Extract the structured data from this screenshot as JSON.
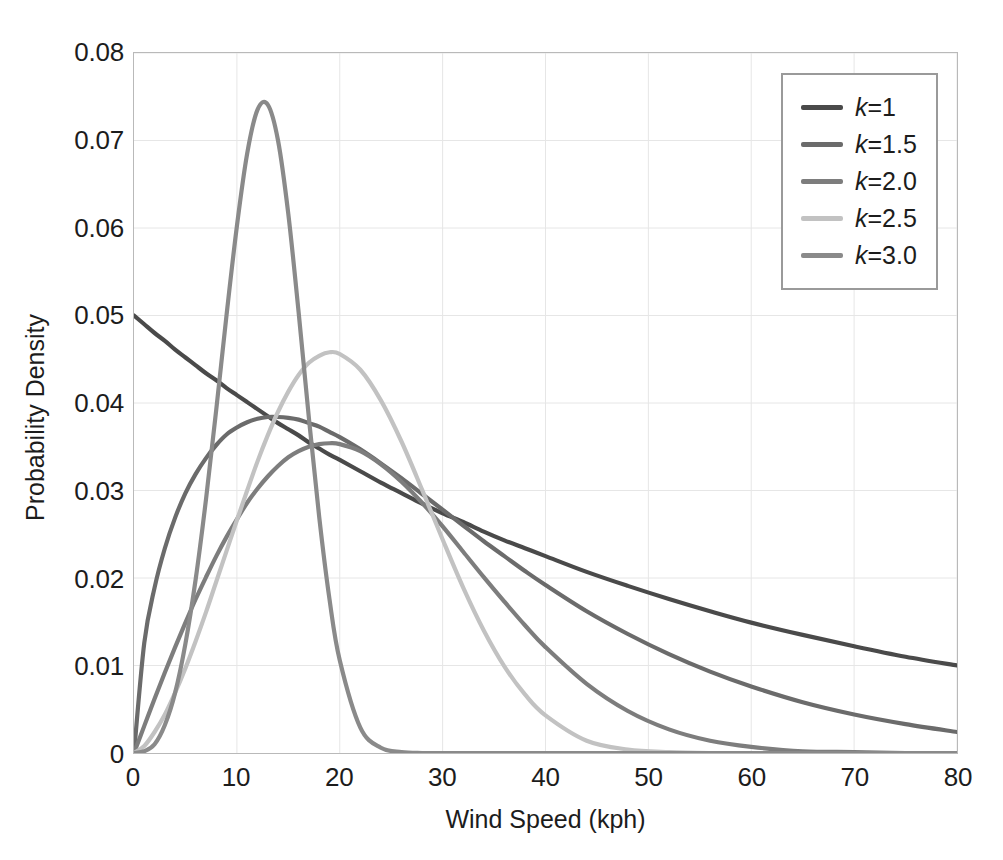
{
  "chart_data": {
    "type": "line",
    "title": "",
    "xlabel": "Wind Speed (kph)",
    "ylabel": "Probability Density",
    "xlim": [
      0,
      80
    ],
    "ylim": [
      0,
      0.08
    ],
    "grid": true,
    "legend_position": "top-right",
    "x_ticks": [
      "0",
      "10",
      "20",
      "30",
      "40",
      "50",
      "60",
      "70",
      "80"
    ],
    "x_tick_values": [
      0,
      10,
      20,
      30,
      40,
      50,
      60,
      70,
      80
    ],
    "y_ticks": [
      "0",
      "0.01",
      "0.02",
      "0.03",
      "0.04",
      "0.05",
      "0.06",
      "0.07",
      "0.08"
    ],
    "y_tick_values": [
      0,
      0.01,
      0.02,
      0.03,
      0.04,
      0.05,
      0.06,
      0.07,
      0.08
    ],
    "x": [
      0,
      1,
      2,
      3,
      4,
      5,
      6,
      7,
      8,
      9,
      10,
      11,
      12,
      13,
      14,
      15,
      16,
      17,
      18,
      19,
      20,
      22,
      24,
      26,
      28,
      30,
      32,
      34,
      36,
      38,
      40,
      44,
      48,
      52,
      56,
      60,
      65,
      70,
      75,
      80
    ],
    "series": [
      {
        "name": "k=1",
        "k": 1,
        "color": "#4a4a4a",
        "peak_x": 0,
        "peak_y": 0.05,
        "values": [
          0.05,
          0.049,
          0.048,
          0.0471,
          0.0461,
          0.0452,
          0.0443,
          0.0434,
          0.0426,
          0.0417,
          0.0409,
          0.0401,
          0.0393,
          0.0385,
          0.0377,
          0.037,
          0.0363,
          0.0355,
          0.0348,
          0.0341,
          0.0335,
          0.0322,
          0.0309,
          0.0297,
          0.0285,
          0.0274,
          0.0264,
          0.0253,
          0.0243,
          0.0234,
          0.0225,
          0.0207,
          0.0191,
          0.0176,
          0.0162,
          0.0149,
          0.0135,
          0.0122,
          0.011,
          0.01
        ]
      },
      {
        "name": "k=1.5",
        "k": 1.5,
        "color": "#6b6b6b",
        "peak_x": 10,
        "peak_y": 0.0372,
        "values": [
          0.0,
          0.0126,
          0.0189,
          0.0234,
          0.0269,
          0.0297,
          0.0319,
          0.0337,
          0.0352,
          0.0364,
          0.0372,
          0.0378,
          0.0382,
          0.0384,
          0.0384,
          0.0383,
          0.0381,
          0.0377,
          0.0373,
          0.0367,
          0.0361,
          0.0347,
          0.0331,
          0.0314,
          0.0296,
          0.0278,
          0.026,
          0.0242,
          0.0225,
          0.0208,
          0.0192,
          0.0162,
          0.0136,
          0.0113,
          0.0093,
          0.0076,
          0.0058,
          0.0044,
          0.0033,
          0.0024
        ]
      },
      {
        "name": "k=2.0",
        "k": 2.0,
        "color": "#7d7d7d",
        "peak_x": 16,
        "peak_y": 0.0428,
        "values": [
          0.0,
          0.0031,
          0.0062,
          0.0092,
          0.0121,
          0.0149,
          0.0176,
          0.0201,
          0.0225,
          0.0247,
          0.0267,
          0.0286,
          0.0302,
          0.0316,
          0.0328,
          0.0338,
          0.0345,
          0.035,
          0.0353,
          0.0354,
          0.0353,
          0.0345,
          0.033,
          0.031,
          0.0286,
          0.0259,
          0.023,
          0.0201,
          0.0173,
          0.0146,
          0.0121,
          0.0079,
          0.0048,
          0.0027,
          0.0014,
          0.0007,
          0.0002,
          0.0001,
          0.0,
          0.0
        ]
      },
      {
        "name": "k=2.5",
        "k": 2.5,
        "color": "#c2c2c2",
        "peak_x": 16,
        "peak_y": 0.0504,
        "values": [
          0.0,
          0.0008,
          0.0024,
          0.0044,
          0.0069,
          0.0097,
          0.0128,
          0.0161,
          0.0196,
          0.0231,
          0.0266,
          0.03,
          0.0333,
          0.0363,
          0.039,
          0.0413,
          0.0432,
          0.0446,
          0.0454,
          0.0458,
          0.0456,
          0.0438,
          0.0403,
          0.0356,
          0.0301,
          0.0244,
          0.0189,
          0.014,
          0.0099,
          0.0067,
          0.0043,
          0.0014,
          0.0004,
          0.0001,
          0.0,
          0.0,
          0.0,
          0.0,
          0.0,
          0.0
        ]
      },
      {
        "name": "k=3.0",
        "k": 3.0,
        "color": "#8a8a8a",
        "peak_x": 14.5,
        "peak_y": 0.074,
        "values": [
          0.0,
          0.0002,
          0.001,
          0.0032,
          0.0069,
          0.0125,
          0.0199,
          0.029,
          0.0393,
          0.0501,
          0.0602,
          0.0685,
          0.0735,
          0.0741,
          0.07,
          0.0616,
          0.0504,
          0.0383,
          0.027,
          0.0176,
          0.0106,
          0.0029,
          0.0006,
          0.0001,
          0.0,
          0.0,
          0.0,
          0.0,
          0.0,
          0.0,
          0.0,
          0.0,
          0.0,
          0.0,
          0.0,
          0.0,
          0.0,
          0.0,
          0.0,
          0.0
        ]
      }
    ],
    "legend_entries": [
      {
        "prefix": "k",
        "suffix": "=1",
        "color": "#4a4a4a"
      },
      {
        "prefix": "k",
        "suffix": "=1.5",
        "color": "#6b6b6b"
      },
      {
        "prefix": "k",
        "suffix": "=2.0",
        "color": "#7d7d7d"
      },
      {
        "prefix": "k",
        "suffix": "=2.5",
        "color": "#c2c2c2"
      },
      {
        "prefix": "k",
        "suffix": "=3.0",
        "color": "#8a8a8a"
      }
    ]
  },
  "style": {
    "grid_color": "#e6e6e6",
    "frame_color": "#b9b9b9",
    "text_color": "#1c1c1c",
    "background": "#ffffff",
    "legend_border": "#9a9a9a"
  }
}
